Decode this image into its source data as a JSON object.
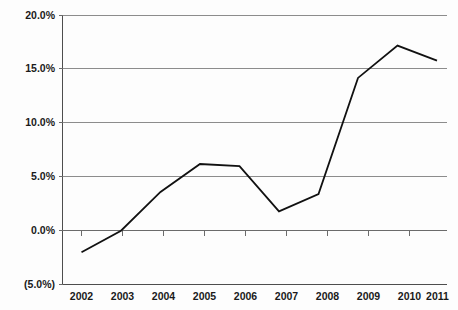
{
  "chart_data": {
    "type": "line",
    "title": "",
    "subtitle": "",
    "xlabel": "",
    "ylabel": "",
    "categories": [
      "2002",
      "2003",
      "2004",
      "2005",
      "2006",
      "2007",
      "2008",
      "2009",
      "2010",
      "2011"
    ],
    "x": [
      2002,
      2003,
      2004,
      2005,
      2006,
      2007,
      2008,
      2009,
      2010,
      2011
    ],
    "values": [
      -2.0,
      0.0,
      3.6,
      6.2,
      6.0,
      1.8,
      3.4,
      14.2,
      17.2,
      15.8
    ],
    "series": [
      {
        "name": "",
        "values": [
          -2.0,
          0.0,
          3.6,
          6.2,
          6.0,
          1.8,
          3.4,
          14.2,
          17.2,
          15.8
        ]
      }
    ],
    "ylim": [
      -5.0,
      20.0
    ],
    "yticks": [
      -5.0,
      0.0,
      5.0,
      10.0,
      15.0,
      20.0
    ],
    "ytick_labels": [
      "(5.0%)",
      "0.0%",
      "5.0%",
      "10.0%",
      "15.0%",
      "20.0%"
    ],
    "xtick_labels": [
      "2002",
      "2003",
      "2004",
      "2005",
      "2006",
      "2007",
      "2008",
      "2009",
      "2010",
      "2011"
    ],
    "grid": true,
    "grid_axis": "y",
    "legend": false,
    "legend_position": "none",
    "annotations": [],
    "unit": "percent",
    "colors": {
      "line": "#111111",
      "grid": "#8c8c8c",
      "axis": "#4d4d4d",
      "background": "#fdfdfd",
      "text": "#1a1a1a"
    }
  },
  "axis": {
    "y_labels": [
      {
        "text": "20.0%",
        "value": 20.0
      },
      {
        "text": "15.0%",
        "value": 15.0
      },
      {
        "text": "10.0%",
        "value": 10.0
      },
      {
        "text": "5.0%",
        "value": 5.0
      },
      {
        "text": "0.0%",
        "value": 0.0
      },
      {
        "text": "(5.0%)",
        "value": -5.0
      }
    ],
    "x_labels": [
      {
        "text": "2002"
      },
      {
        "text": "2003"
      },
      {
        "text": "2004"
      },
      {
        "text": "2005"
      },
      {
        "text": "2006"
      },
      {
        "text": "2007"
      },
      {
        "text": "2008"
      },
      {
        "text": "2009"
      },
      {
        "text": "2010"
      },
      {
        "text": "2011"
      }
    ]
  }
}
